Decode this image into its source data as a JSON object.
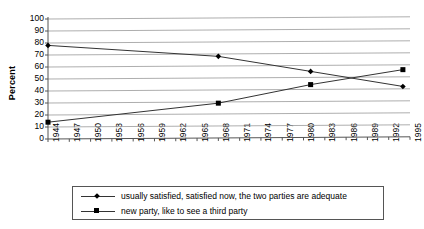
{
  "chart_data": {
    "type": "line",
    "title": "",
    "xlabel": "",
    "ylabel": "Percent",
    "ylim": [
      0,
      100
    ],
    "ytick_step": 10,
    "grid": true,
    "legend_position": "bottom",
    "categories": [
      "1944",
      "1947",
      "1950",
      "1953",
      "1956",
      "1959",
      "1962",
      "1965",
      "1968",
      "1971",
      "1974",
      "1977",
      "1980",
      "1983",
      "1986",
      "1989",
      "1992",
      "1995"
    ],
    "ytick_labels": [
      "100",
      "90",
      "80",
      "70",
      "60",
      "50",
      "40",
      "30",
      "20",
      "10",
      "0"
    ],
    "series": [
      {
        "name": "usually satisfied, satisfied now, the two parties are adequate",
        "marker": "diamond",
        "points": [
          {
            "x": "1944",
            "y": 78
          },
          {
            "x": "1968",
            "y": 68
          },
          {
            "x": "1981",
            "y": 55
          },
          {
            "x": "1994",
            "y": 42
          }
        ]
      },
      {
        "name": "new party, like to see a third party",
        "marker": "square",
        "points": [
          {
            "x": "1944",
            "y": 14
          },
          {
            "x": "1968",
            "y": 29
          },
          {
            "x": "1981",
            "y": 44
          },
          {
            "x": "1994",
            "y": 56
          }
        ]
      }
    ],
    "colors": {
      "series_line": "#333333",
      "marker": "#000000",
      "gridline": "#999999",
      "axis": "#555555",
      "background": "#ffffff"
    }
  },
  "legend": {
    "items": [
      {
        "label": "usually satisfied, satisfied now, the two parties are adequate",
        "marker": "diamond"
      },
      {
        "label": "new party, like to see a third party",
        "marker": "square"
      }
    ]
  }
}
